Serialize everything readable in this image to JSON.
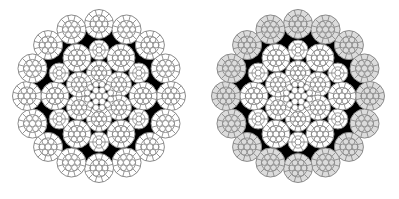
{
  "figure": {
    "background": "#ffffff",
    "fill_color": "#000000",
    "wire_stroke": "#8a8a8a",
    "panels": [
      {
        "id": "left",
        "cx": 99,
        "cy": 96,
        "outer_wire_fill": "#ffffff"
      },
      {
        "id": "right",
        "cx": 298,
        "cy": 96,
        "outer_wire_fill": "#dcdcdc"
      }
    ],
    "structure": {
      "core_wires": 19,
      "inner_strands": 6,
      "middle_large_strands": 6,
      "middle_small_strands": 6,
      "outer_strands": 16
    }
  }
}
